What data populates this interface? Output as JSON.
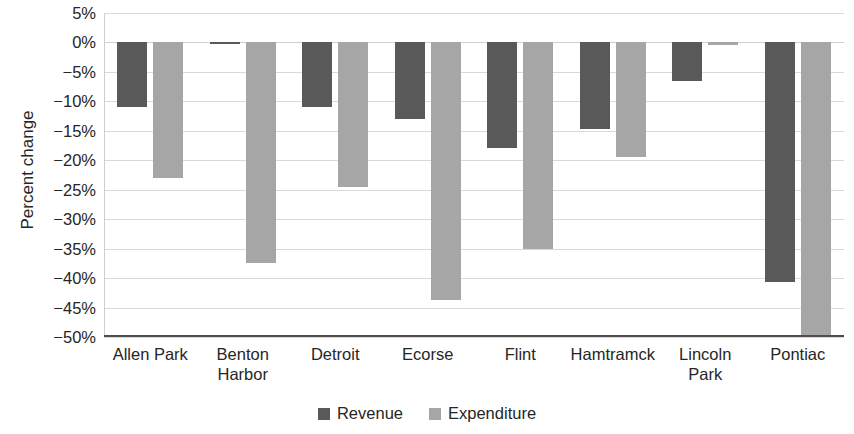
{
  "chart_data": {
    "type": "bar",
    "title": "",
    "xlabel": "",
    "ylabel": "Percent change",
    "ylim": [
      -50,
      5
    ],
    "ytick_step": 5,
    "ytick_labels": [
      "5%",
      "0%",
      "−5%",
      "−10%",
      "−15%",
      "−20%",
      "−25%",
      "−30%",
      "−35%",
      "−40%",
      "−45%",
      "−50%"
    ],
    "ytick_values": [
      5,
      0,
      -5,
      -10,
      -15,
      -20,
      -25,
      -30,
      -35,
      -40,
      -45,
      -50
    ],
    "grid": true,
    "legend_position": "bottom",
    "categories": [
      "Allen Park",
      "Benton Harbor",
      "Detroit",
      "Ecorse",
      "Flint",
      "Hamtramck",
      "Lincoln Park",
      "Pontiac"
    ],
    "category_lines": [
      [
        "Allen Park"
      ],
      [
        "Benton",
        "Harbor"
      ],
      [
        "Detroit"
      ],
      [
        "Ecorse"
      ],
      [
        "Flint"
      ],
      [
        "Hamtramck"
      ],
      [
        "Lincoln",
        "Park"
      ],
      [
        "Pontiac"
      ]
    ],
    "series": [
      {
        "name": "Revenue",
        "color": "#595959",
        "values": [
          -11.0,
          -0.3,
          -11.0,
          -13.0,
          -18.0,
          -14.7,
          -6.5,
          -40.7
        ]
      },
      {
        "name": "Expenditure",
        "color": "#a6a6a6",
        "values": [
          -23.0,
          -37.5,
          -24.5,
          -43.7,
          -35.0,
          -19.5,
          -0.5,
          -50.0
        ]
      }
    ]
  },
  "legend": {
    "items": [
      {
        "label": "Revenue",
        "swatch": "revenue"
      },
      {
        "label": "Expenditure",
        "swatch": "expenditure"
      }
    ]
  }
}
